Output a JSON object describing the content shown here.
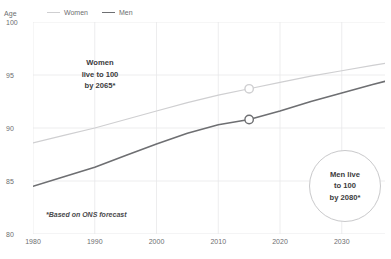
{
  "chart_data": {
    "type": "line",
    "title": "",
    "xlabel": "",
    "ylabel": "Age",
    "xlim": [
      1980,
      2037
    ],
    "ylim": [
      80,
      100
    ],
    "grid": true,
    "legend_position": "top-left",
    "x_ticks": [
      "1980",
      "1990",
      "2000",
      "2010",
      "2020",
      "2030"
    ],
    "x_tick_values": [
      1980,
      1990,
      2000,
      2010,
      2020,
      2030
    ],
    "y_ticks": [
      "100",
      "95",
      "90",
      "85",
      "80"
    ],
    "y_tick_values": [
      100,
      95,
      90,
      85,
      80
    ],
    "series": [
      {
        "name": "Women",
        "color": "#cfcfd1",
        "x": [
          1980,
          1985,
          1990,
          1995,
          2000,
          2005,
          2010,
          2015,
          2020,
          2025,
          2030,
          2035,
          2037
        ],
        "values": [
          88.6,
          89.3,
          90.0,
          90.8,
          91.6,
          92.4,
          93.1,
          93.7,
          94.3,
          94.9,
          95.4,
          95.9,
          96.1
        ]
      },
      {
        "name": "Men",
        "color": "#6e6f72",
        "x": [
          1980,
          1985,
          1990,
          1995,
          2000,
          2005,
          2010,
          2015,
          2020,
          2025,
          2030,
          2035,
          2037
        ],
        "values": [
          84.5,
          85.4,
          86.3,
          87.4,
          88.5,
          89.5,
          90.3,
          90.8,
          91.6,
          92.5,
          93.3,
          94.1,
          94.4
        ]
      }
    ],
    "markers": [
      {
        "series": "Women",
        "x": 2015,
        "y": 93.7
      },
      {
        "series": "Men",
        "x": 2015,
        "y": 90.8
      }
    ],
    "annotations": [
      {
        "name": "women-callout",
        "lines": [
          "Women",
          "live to 100",
          "by 2065*"
        ]
      },
      {
        "name": "men-callout",
        "lines": [
          "Men live",
          "to 100",
          "by 2080*"
        ]
      },
      {
        "name": "footnote",
        "text": "*Based on ONS forecast"
      }
    ]
  },
  "legend": {
    "items": [
      {
        "label": "Women"
      },
      {
        "label": "Men"
      }
    ]
  },
  "axis": {
    "y_title": "Age"
  },
  "callouts": {
    "women": {
      "line1": "Women",
      "line2": "live to 100",
      "line3": "by 2065*"
    },
    "men": {
      "line1": "Men live",
      "line2": "to 100",
      "line3": "by 2080*"
    }
  },
  "footnote": {
    "text": "*Based on ONS forecast"
  },
  "colors": {
    "women_line": "#cfcfd1",
    "men_line": "#6e6f72",
    "grid": "#e8e8ea",
    "text": "#6d6e70"
  }
}
